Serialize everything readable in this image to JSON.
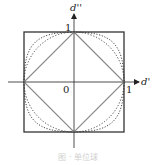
{
  "figure": {
    "axes": {
      "x_label": "d'",
      "y_label": "d''",
      "origin_label": "0",
      "x_tick_label": "1",
      "y_tick_label": "1"
    },
    "shapes": [
      {
        "name": "square",
        "style": "solid",
        "description": "L-infinity unit ball"
      },
      {
        "name": "diamond",
        "style": "solid",
        "description": "L1 unit ball"
      },
      {
        "name": "circle",
        "style": "dotted",
        "description": "L2 unit ball"
      },
      {
        "name": "squircle",
        "style": "dotted",
        "description": "Lp unit ball (p>2)"
      }
    ],
    "caption": "图 · 单位球"
  },
  "colors": {
    "axis": "#222222",
    "square": "#333333",
    "diamond": "#8a8a8a",
    "dotted": "#333333",
    "caption": "#d0d0d0"
  }
}
